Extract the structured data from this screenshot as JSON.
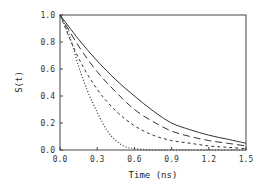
{
  "chart_data": {
    "type": "line",
    "title": "",
    "xlabel": "Time  (ns)",
    "ylabel": "S(t)",
    "xlim": [
      0.0,
      1.5
    ],
    "ylim": [
      0.0,
      1.0
    ],
    "xticks": [
      "0.0",
      "0.3",
      "0.6",
      "0.9",
      "1.2",
      "1.5"
    ],
    "yticks": [
      "0.0",
      "0.2",
      "0.4",
      "0.6",
      "0.8",
      "1.0"
    ],
    "grid": false,
    "legend": null,
    "series": [
      {
        "name": "solid",
        "style": "solid",
        "x": [
          0.0,
          0.15,
          0.3,
          0.45,
          0.6,
          0.75,
          0.9,
          1.05,
          1.2,
          1.35,
          1.5
        ],
        "y": [
          1.0,
          0.82,
          0.66,
          0.52,
          0.4,
          0.29,
          0.2,
          0.15,
          0.11,
          0.08,
          0.05
        ]
      },
      {
        "name": "long-dash",
        "style": "long-dash",
        "x": [
          0.0,
          0.15,
          0.3,
          0.45,
          0.6,
          0.75,
          0.9,
          1.05,
          1.2,
          1.35,
          1.5
        ],
        "y": [
          1.0,
          0.77,
          0.58,
          0.43,
          0.3,
          0.21,
          0.14,
          0.1,
          0.07,
          0.05,
          0.03
        ]
      },
      {
        "name": "short-dash",
        "style": "short-dash",
        "x": [
          0.0,
          0.15,
          0.3,
          0.45,
          0.6,
          0.75,
          0.9,
          1.05,
          1.2,
          1.35,
          1.5
        ],
        "y": [
          1.0,
          0.68,
          0.45,
          0.29,
          0.18,
          0.11,
          0.07,
          0.05,
          0.03,
          0.02,
          0.01
        ]
      },
      {
        "name": "dotted",
        "style": "dotted",
        "x": [
          0.0,
          0.075,
          0.15,
          0.225,
          0.3,
          0.375,
          0.45,
          0.525,
          0.6,
          0.75,
          0.9,
          1.2,
          1.5
        ],
        "y": [
          1.0,
          0.85,
          0.62,
          0.43,
          0.28,
          0.15,
          0.07,
          0.025,
          0.01,
          0.0,
          0.0,
          0.0,
          0.0
        ]
      }
    ]
  }
}
